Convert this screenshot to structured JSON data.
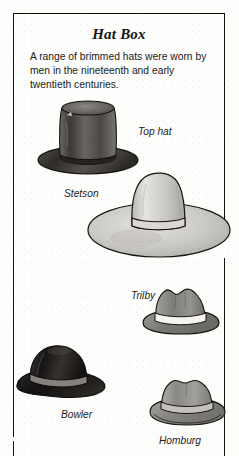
{
  "box": {
    "title": "Hat Box",
    "blurb": "A range of brimmed hats were worn by men in the nineteenth and early twentieth centuries.",
    "border_color": "#15100e",
    "background_color": "#fdfdfc"
  },
  "hats": [
    {
      "id": "top-hat",
      "label": "Top hat",
      "crown_color": "#595552",
      "brim_color": "#3e3a38"
    },
    {
      "id": "stetson",
      "label": "Stetson",
      "crown_color": "#cfcdc9",
      "brim_color": "#c4c2be"
    },
    {
      "id": "trilby",
      "label": "Trilby",
      "crown_color": "#8d8b87",
      "brim_color": "#8a8884",
      "band_color": "#f2f1ee"
    },
    {
      "id": "bowler",
      "label": "Bowler",
      "crown_color": "#2a2725",
      "brim_color": "#1d1b1a",
      "band_color": "#7c7873"
    },
    {
      "id": "homburg",
      "label": "Homburg",
      "crown_color": "#9a9893",
      "brim_color": "#8e8c88",
      "band_color": "#b9b7b2"
    }
  ]
}
